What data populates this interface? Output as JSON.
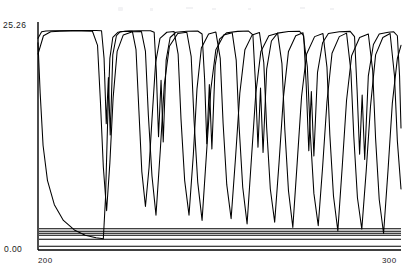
{
  "chart_data": {
    "type": "line",
    "title": "",
    "xlabel": "",
    "ylabel": "",
    "xlim": [
      200,
      300
    ],
    "ylim": [
      0.0,
      25.26
    ],
    "grid": false,
    "legend": null,
    "axis_ticks": {
      "y_max_label": "25.26",
      "y_min_label": "0.00",
      "x_min_label": "200",
      "x_max_label": "300"
    },
    "stroke_color": "#000000",
    "background_color": "#ffffff",
    "series": [
      {
        "name": "trace-1",
        "comment": "Upper envelope: long plateau near 25.26 broken by deep V-shaped drops.",
        "points": [
          [
            200.0,
            24.3
          ],
          [
            201.0,
            25.05
          ],
          [
            202.2,
            25.15
          ],
          [
            204.0,
            25.18
          ],
          [
            210.0,
            25.2
          ],
          [
            216.0,
            25.2
          ],
          [
            217.5,
            25.18
          ],
          [
            218.2,
            22.0
          ],
          [
            218.8,
            14.5
          ],
          [
            219.4,
            19.8
          ],
          [
            219.9,
            13.2
          ],
          [
            220.6,
            22.4
          ],
          [
            221.6,
            24.6
          ],
          [
            222.6,
            25.05
          ],
          [
            225.0,
            25.15
          ],
          [
            228.0,
            25.18
          ],
          [
            231.0,
            25.18
          ],
          [
            232.0,
            25.0
          ],
          [
            232.6,
            20.5
          ],
          [
            233.2,
            13.0
          ],
          [
            233.9,
            19.5
          ],
          [
            234.5,
            12.4
          ],
          [
            235.3,
            21.8
          ],
          [
            236.4,
            24.4
          ],
          [
            238.0,
            25.0
          ],
          [
            241.0,
            25.12
          ],
          [
            244.0,
            25.15
          ],
          [
            245.2,
            24.8
          ],
          [
            245.9,
            19.6
          ],
          [
            246.5,
            12.2
          ],
          [
            247.2,
            19.0
          ],
          [
            247.9,
            11.6
          ],
          [
            248.8,
            21.2
          ],
          [
            250.0,
            24.2
          ],
          [
            252.0,
            24.95
          ],
          [
            255.0,
            25.1
          ],
          [
            258.0,
            25.14
          ],
          [
            259.2,
            24.7
          ],
          [
            259.9,
            19.2
          ],
          [
            260.6,
            11.8
          ],
          [
            261.3,
            18.6
          ],
          [
            262.0,
            11.2
          ],
          [
            263.0,
            20.8
          ],
          [
            264.3,
            24.0
          ],
          [
            266.0,
            24.9
          ],
          [
            269.0,
            25.08
          ],
          [
            272.0,
            25.12
          ],
          [
            273.2,
            24.6
          ],
          [
            273.9,
            18.8
          ],
          [
            274.6,
            11.4
          ],
          [
            275.3,
            18.2
          ],
          [
            276.0,
            10.8
          ],
          [
            277.0,
            20.4
          ],
          [
            278.4,
            23.8
          ],
          [
            280.0,
            24.85
          ],
          [
            283.0,
            25.05
          ],
          [
            286.0,
            25.1
          ],
          [
            287.2,
            24.5
          ],
          [
            287.9,
            18.4
          ],
          [
            288.6,
            11.0
          ],
          [
            289.3,
            17.8
          ],
          [
            290.0,
            10.4
          ],
          [
            291.0,
            20.0
          ],
          [
            292.4,
            23.6
          ],
          [
            294.0,
            24.8
          ],
          [
            296.5,
            25.0
          ],
          [
            298.0,
            25.05
          ],
          [
            299.0,
            24.6
          ],
          [
            299.6,
            20.0
          ],
          [
            300.0,
            14.0
          ]
        ]
      },
      {
        "name": "trace-2",
        "comment": "Mid trace: sawtooth with deep excursions reaching well below mid-scale.",
        "points": [
          [
            200.0,
            23.8
          ],
          [
            200.6,
            18.0
          ],
          [
            201.4,
            12.0
          ],
          [
            202.6,
            8.0
          ],
          [
            204.5,
            5.2
          ],
          [
            207.0,
            3.4
          ],
          [
            210.0,
            2.3
          ],
          [
            213.0,
            1.7
          ],
          [
            216.0,
            1.4
          ],
          [
            218.0,
            1.3
          ],
          [
            218.6,
            6.0
          ],
          [
            219.2,
            15.0
          ],
          [
            219.8,
            22.0
          ],
          [
            220.6,
            24.4
          ],
          [
            222.0,
            25.0
          ],
          [
            224.0,
            25.12
          ],
          [
            226.0,
            25.1
          ],
          [
            227.0,
            23.0
          ],
          [
            227.8,
            16.0
          ],
          [
            228.6,
            9.0
          ],
          [
            229.6,
            5.0
          ],
          [
            230.6,
            9.5
          ],
          [
            231.4,
            15.0
          ],
          [
            232.4,
            21.5
          ],
          [
            233.6,
            24.3
          ],
          [
            235.5,
            25.0
          ],
          [
            237.5,
            25.08
          ],
          [
            238.6,
            22.5
          ],
          [
            239.4,
            15.0
          ],
          [
            240.4,
            8.0
          ],
          [
            241.6,
            4.0
          ],
          [
            242.8,
            11.0
          ],
          [
            243.8,
            18.5
          ],
          [
            245.0,
            23.2
          ],
          [
            247.0,
            24.8
          ],
          [
            249.0,
            25.02
          ],
          [
            250.2,
            22.0
          ],
          [
            251.0,
            14.5
          ],
          [
            252.0,
            7.5
          ],
          [
            253.2,
            3.6
          ],
          [
            254.4,
            10.5
          ],
          [
            255.6,
            18.0
          ],
          [
            257.0,
            23.0
          ],
          [
            259.0,
            24.7
          ],
          [
            261.0,
            24.98
          ],
          [
            262.2,
            21.5
          ],
          [
            263.0,
            14.0
          ],
          [
            264.0,
            7.0
          ],
          [
            265.2,
            3.2
          ],
          [
            266.4,
            10.0
          ],
          [
            267.6,
            17.5
          ],
          [
            269.0,
            22.8
          ],
          [
            271.0,
            24.6
          ],
          [
            273.0,
            24.95
          ],
          [
            274.2,
            21.0
          ],
          [
            275.0,
            13.5
          ],
          [
            276.0,
            6.5
          ],
          [
            277.2,
            2.8
          ],
          [
            278.4,
            9.5
          ],
          [
            279.6,
            17.0
          ],
          [
            281.0,
            22.6
          ],
          [
            283.0,
            24.5
          ],
          [
            285.0,
            24.9
          ],
          [
            286.2,
            20.5
          ],
          [
            287.0,
            13.0
          ],
          [
            288.0,
            6.0
          ],
          [
            289.2,
            2.4
          ],
          [
            290.4,
            9.0
          ],
          [
            291.6,
            16.5
          ],
          [
            293.0,
            22.4
          ],
          [
            295.0,
            24.4
          ],
          [
            297.0,
            24.85
          ],
          [
            298.2,
            20.0
          ],
          [
            299.0,
            12.5
          ],
          [
            300.0,
            7.0
          ]
        ]
      },
      {
        "name": "trace-3",
        "comment": "Lower-phase trace: offset sawtooth with the deepest spikes.",
        "points": [
          [
            200.0,
            22.5
          ],
          [
            201.5,
            24.6
          ],
          [
            203.5,
            25.05
          ],
          [
            206.0,
            25.12
          ],
          [
            209.0,
            25.14
          ],
          [
            212.0,
            25.14
          ],
          [
            215.0,
            25.12
          ],
          [
            216.4,
            23.5
          ],
          [
            217.2,
            17.0
          ],
          [
            218.0,
            9.5
          ],
          [
            218.9,
            4.5
          ],
          [
            219.8,
            10.0
          ],
          [
            220.7,
            17.5
          ],
          [
            221.8,
            22.8
          ],
          [
            223.5,
            24.7
          ],
          [
            226.0,
            25.05
          ],
          [
            228.5,
            25.08
          ],
          [
            229.6,
            22.8
          ],
          [
            230.4,
            15.5
          ],
          [
            231.4,
            8.5
          ],
          [
            232.5,
            4.0
          ],
          [
            233.7,
            11.5
          ],
          [
            234.8,
            19.0
          ],
          [
            236.2,
            23.4
          ],
          [
            238.5,
            24.85
          ],
          [
            241.0,
            25.0
          ],
          [
            242.2,
            22.2
          ],
          [
            243.0,
            14.8
          ],
          [
            244.0,
            7.8
          ],
          [
            245.2,
            3.4
          ],
          [
            246.4,
            11.0
          ],
          [
            247.6,
            18.4
          ],
          [
            249.0,
            23.0
          ],
          [
            251.2,
            24.7
          ],
          [
            253.5,
            24.95
          ],
          [
            254.6,
            21.8
          ],
          [
            255.4,
            14.2
          ],
          [
            256.4,
            7.2
          ],
          [
            257.6,
            3.0
          ],
          [
            258.8,
            10.5
          ],
          [
            260.0,
            18.0
          ],
          [
            261.4,
            22.8
          ],
          [
            263.6,
            24.6
          ],
          [
            266.0,
            24.9
          ],
          [
            267.2,
            21.4
          ],
          [
            268.0,
            13.8
          ],
          [
            269.0,
            6.8
          ],
          [
            270.2,
            2.6
          ],
          [
            271.4,
            10.0
          ],
          [
            272.6,
            17.6
          ],
          [
            274.0,
            22.5
          ],
          [
            276.2,
            24.5
          ],
          [
            278.5,
            24.85
          ],
          [
            279.6,
            21.0
          ],
          [
            280.4,
            13.2
          ],
          [
            281.4,
            6.2
          ],
          [
            282.6,
            2.2
          ],
          [
            283.8,
            9.5
          ],
          [
            285.0,
            17.2
          ],
          [
            286.4,
            22.3
          ],
          [
            288.6,
            24.4
          ],
          [
            291.0,
            24.8
          ],
          [
            292.2,
            20.6
          ],
          [
            293.0,
            12.8
          ],
          [
            294.0,
            5.8
          ],
          [
            295.2,
            1.9
          ],
          [
            296.4,
            9.0
          ],
          [
            297.6,
            16.8
          ],
          [
            299.0,
            22.0
          ],
          [
            300.0,
            23.5
          ]
        ]
      },
      {
        "name": "baseline-band-1",
        "comment": "Near-constant low trace.",
        "constant_value": 2.45
      },
      {
        "name": "baseline-band-2",
        "comment": "Near-constant low trace.",
        "constant_value": 2.16
      },
      {
        "name": "baseline-band-3",
        "comment": "Near-constant low trace.",
        "constant_value": 1.93
      },
      {
        "name": "baseline-band-4",
        "comment": "Near-constant low trace.",
        "constant_value": 1.7
      },
      {
        "name": "baseline-band-5",
        "comment": "Near-constant low trace.",
        "constant_value": 1.24
      },
      {
        "name": "baseline-band-6",
        "comment": "Near-constant low trace, closest to axis.",
        "constant_value": 0.42
      }
    ]
  }
}
